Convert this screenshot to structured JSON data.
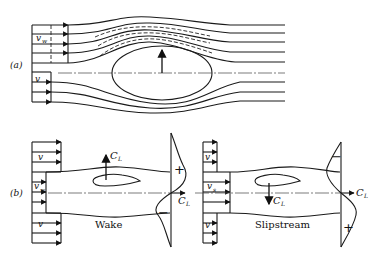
{
  "figure": {
    "panel_a": {
      "label": "(a)",
      "freestream_upper": {
        "symbol": "v",
        "subscript": "w"
      },
      "freestream_lower": {
        "symbol": "v"
      }
    },
    "panel_b": {
      "label": "(b)",
      "wake": {
        "caption": "Wake",
        "upper_velocity": "v",
        "middle_velocity": {
          "symbol": "v",
          "subscript": "w"
        },
        "lower_velocity": "v",
        "lift_label": {
          "symbol": "C",
          "subscript": "L"
        },
        "axis_label": {
          "symbol": "C",
          "subscript": "L"
        },
        "upper_sign": "+",
        "lower_sign": "−"
      },
      "slipstream": {
        "caption": "Slipstream",
        "upper_velocity": "v",
        "middle_velocity": {
          "symbol": "v",
          "subscript": "s"
        },
        "lower_velocity": "v",
        "lift_label": {
          "symbol": "C",
          "subscript": "L"
        },
        "axis_label": {
          "symbol": "C",
          "subscript": "L"
        },
        "upper_sign": "−",
        "lower_sign": "+"
      }
    }
  }
}
